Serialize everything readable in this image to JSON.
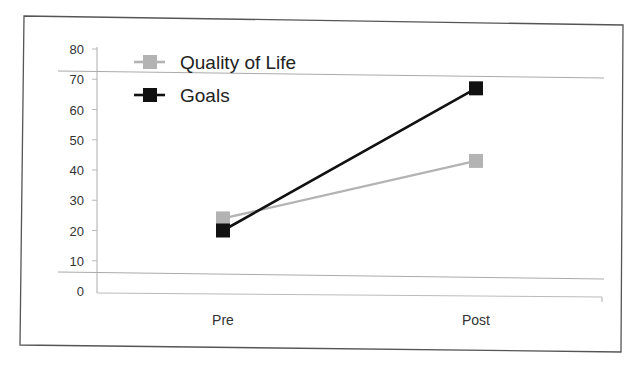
{
  "chart_data": {
    "type": "line",
    "title": "",
    "xlabel": "",
    "ylabel": "",
    "categories": [
      "Pre",
      "Post"
    ],
    "series": [
      {
        "name": "Quality of Life",
        "values": [
          24,
          43
        ],
        "color": "#b3b3b3",
        "marker": "square"
      },
      {
        "name": "Goals",
        "values": [
          20,
          67
        ],
        "color": "#111111",
        "marker": "square"
      }
    ],
    "ylim": [
      0,
      80
    ],
    "yticks": [
      0,
      10,
      20,
      30,
      40,
      50,
      60,
      70,
      80
    ],
    "grid": false,
    "reference_lines": [
      72,
      5
    ],
    "legend": {
      "position": "top-left",
      "entries": [
        "Quality of Life",
        "Goals"
      ]
    }
  },
  "colors": {
    "frame": "#555555",
    "axis": "#bbbbbb",
    "text": "#333333"
  }
}
